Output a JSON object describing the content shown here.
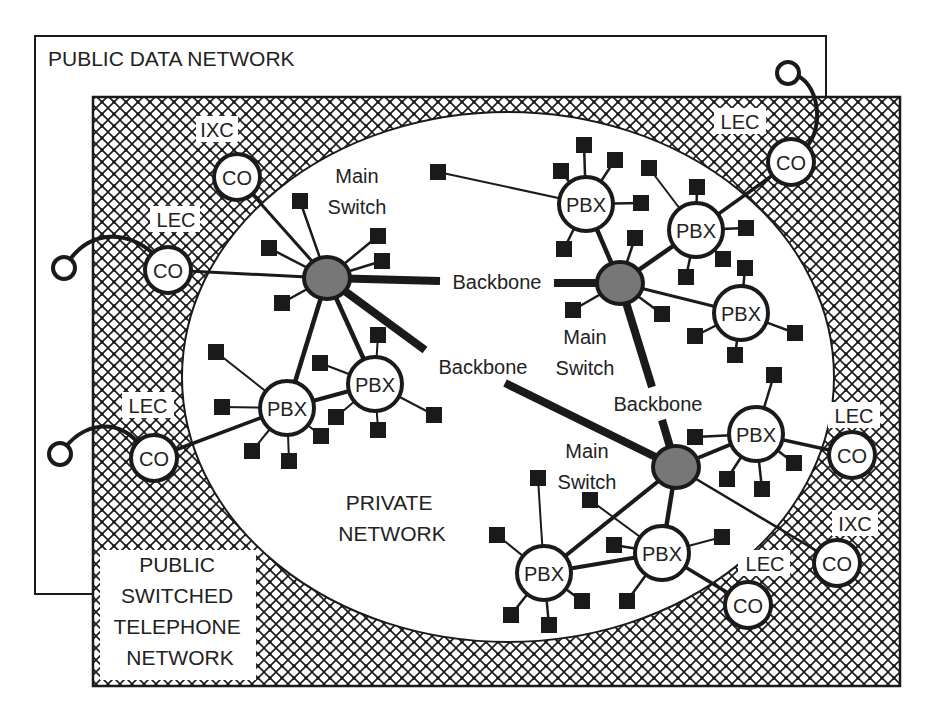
{
  "colors": {
    "ink": "#1a1a1a",
    "switch_fill": "#777777",
    "background": "#ffffff"
  },
  "regions": {
    "public_data_network": "PUBLIC DATA NETWORK",
    "pstn_line1": "PUBLIC",
    "pstn_line2": "SWITCHED",
    "pstn_line3": "TELEPHONE",
    "pstn_line4": "NETWORK",
    "private_line1": "PRIVATE",
    "private_line2": "NETWORK"
  },
  "labels": {
    "main_switch_1a": "Main",
    "main_switch_1b": "Switch",
    "main_switch_2a": "Main",
    "main_switch_2b": "Switch",
    "main_switch_3a": "Main",
    "main_switch_3b": "Switch",
    "backbone_1": "Backbone",
    "backbone_2": "Backbone",
    "backbone_3": "Backbone",
    "ixc_top": "IXC",
    "lec_left_top": "LEC",
    "lec_left_bottom": "LEC",
    "lec_top_right": "LEC",
    "lec_right": "LEC",
    "ixc_right": "IXC",
    "lec_bottom": "LEC"
  },
  "nodes": {
    "co": "CO",
    "pbx": "PBX"
  }
}
